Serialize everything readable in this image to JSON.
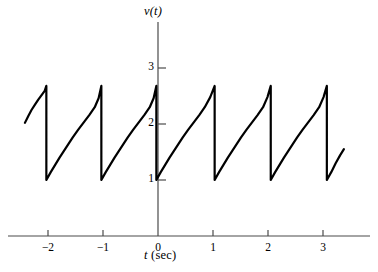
{
  "chart_data": {
    "type": "line",
    "title": "",
    "subtitle": "",
    "xlabel": "t (sec)",
    "xlabel_symbol": "t",
    "xlabel_unit": "(sec)",
    "ylabel": "v(t)",
    "xlim": [
      -2.5,
      3.45
    ],
    "ylim": [
      0,
      3.5
    ],
    "xticks": [
      -2,
      -1,
      0,
      1,
      2,
      3
    ],
    "xticklabels": [
      "−2",
      "−1",
      "0",
      "1",
      "2",
      "3"
    ],
    "yticks": [
      1,
      2,
      3
    ],
    "yticklabels": [
      "1",
      "2",
      "3"
    ],
    "grid": false,
    "legend": null,
    "waveform": {
      "period_sec": 1.0,
      "min_value": 1.0,
      "peak_value": 2.68,
      "shape": "exponential-rise-then-vertical-drop",
      "drop_times": [
        -2.03,
        -1.03,
        -0.03,
        1.03,
        2.05,
        3.07
      ],
      "left_clip_t": -2.42,
      "left_clip_value": 2.02,
      "right_clip_t": 3.38,
      "right_clip_value": 1.55
    },
    "series": [
      {
        "name": "v(t)",
        "color": "#000000",
        "linewidth": 2.2,
        "points": [
          [
            -2.42,
            2.02
          ],
          [
            -2.36,
            2.14
          ],
          [
            -2.3,
            2.25
          ],
          [
            -2.24,
            2.34
          ],
          [
            -2.18,
            2.43
          ],
          [
            -2.12,
            2.51
          ],
          [
            -2.06,
            2.59
          ],
          [
            -2.03,
            2.68
          ],
          [
            -2.03,
            1.0
          ],
          [
            -1.95,
            1.14
          ],
          [
            -1.87,
            1.27
          ],
          [
            -1.79,
            1.4
          ],
          [
            -1.71,
            1.52
          ],
          [
            -1.63,
            1.64
          ],
          [
            -1.55,
            1.76
          ],
          [
            -1.45,
            1.9
          ],
          [
            -1.35,
            2.03
          ],
          [
            -1.25,
            2.16
          ],
          [
            -1.15,
            2.3
          ],
          [
            -1.08,
            2.46
          ],
          [
            -1.03,
            2.68
          ],
          [
            -1.03,
            1.0
          ],
          [
            -0.95,
            1.14
          ],
          [
            -0.87,
            1.27
          ],
          [
            -0.79,
            1.4
          ],
          [
            -0.71,
            1.52
          ],
          [
            -0.63,
            1.64
          ],
          [
            -0.55,
            1.76
          ],
          [
            -0.45,
            1.9
          ],
          [
            -0.35,
            2.03
          ],
          [
            -0.25,
            2.16
          ],
          [
            -0.15,
            2.3
          ],
          [
            -0.08,
            2.46
          ],
          [
            -0.03,
            2.68
          ],
          [
            -0.03,
            1.0
          ],
          [
            0.05,
            1.14
          ],
          [
            0.13,
            1.27
          ],
          [
            0.21,
            1.4
          ],
          [
            0.29,
            1.52
          ],
          [
            0.37,
            1.64
          ],
          [
            0.45,
            1.76
          ],
          [
            0.55,
            1.9
          ],
          [
            0.65,
            2.03
          ],
          [
            0.75,
            2.16
          ],
          [
            0.85,
            2.3
          ],
          [
            0.95,
            2.48
          ],
          [
            1.03,
            2.68
          ],
          [
            1.03,
            1.0
          ],
          [
            1.11,
            1.14
          ],
          [
            1.19,
            1.27
          ],
          [
            1.27,
            1.4
          ],
          [
            1.35,
            1.52
          ],
          [
            1.43,
            1.64
          ],
          [
            1.51,
            1.76
          ],
          [
            1.61,
            1.9
          ],
          [
            1.71,
            2.03
          ],
          [
            1.81,
            2.16
          ],
          [
            1.91,
            2.3
          ],
          [
            1.99,
            2.48
          ],
          [
            2.05,
            2.68
          ],
          [
            2.05,
            1.0
          ],
          [
            2.13,
            1.14
          ],
          [
            2.21,
            1.27
          ],
          [
            2.29,
            1.4
          ],
          [
            2.37,
            1.52
          ],
          [
            2.45,
            1.64
          ],
          [
            2.53,
            1.76
          ],
          [
            2.63,
            1.9
          ],
          [
            2.73,
            2.03
          ],
          [
            2.83,
            2.16
          ],
          [
            2.93,
            2.3
          ],
          [
            3.01,
            2.48
          ],
          [
            3.07,
            2.68
          ],
          [
            3.07,
            1.0
          ],
          [
            3.15,
            1.14
          ],
          [
            3.23,
            1.3
          ],
          [
            3.31,
            1.44
          ],
          [
            3.38,
            1.55
          ]
        ]
      }
    ],
    "axes_style": {
      "axis_color": "#4a4a4a",
      "tick_color": "#4a4a4a",
      "curve_color": "#000000",
      "background": "#ffffff"
    }
  },
  "geometry": {
    "origin_x_px": 158,
    "origin_y_px": 236,
    "px_per_unit_x": 55,
    "px_per_unit_y": 56,
    "x_axis_start_px": 8,
    "x_axis_end_px": 370,
    "y_axis_top_px": 22,
    "tick_len_px": 6
  }
}
